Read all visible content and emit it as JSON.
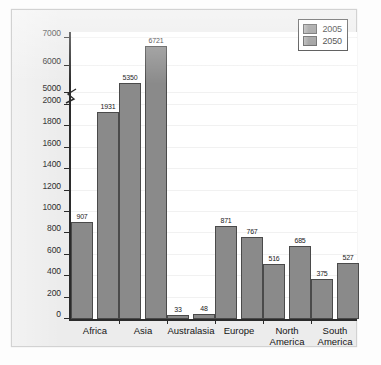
{
  "chart_data": {
    "type": "bar",
    "title": "",
    "xlabel": "",
    "ylabel": "Population (in millions)",
    "categories": [
      "Africa",
      "Asia",
      "Australasia",
      "Europe",
      "North\nAmerica",
      "South\nAmerica"
    ],
    "series": [
      {
        "name": "2005",
        "values": [
          907,
          5350,
          33,
          871,
          516,
          375
        ],
        "color": "#8a8a8a"
      },
      {
        "name": "2050",
        "values": [
          1931,
          6721,
          48,
          767,
          685,
          527
        ],
        "color": "#8a8a8a"
      }
    ],
    "legend": {
      "position": "top-right",
      "entries": [
        "2005",
        "2050"
      ]
    },
    "grid": true,
    "broken_axis": true,
    "axis_break_between": [
      2000,
      5000
    ],
    "y_ticks_lower": [
      0,
      200,
      400,
      600,
      800,
      1000,
      1200,
      1400,
      1600,
      1800,
      2000
    ],
    "y_ticks_upper": [
      5000,
      6000,
      7000
    ],
    "ylim_lower": [
      0,
      2000
    ],
    "ylim_upper": [
      5000,
      7000
    ],
    "value_labels": [
      "907",
      "1931",
      "5350",
      "6721",
      "33",
      "48",
      "871",
      "767",
      "516",
      "685",
      "375",
      "527"
    ]
  }
}
